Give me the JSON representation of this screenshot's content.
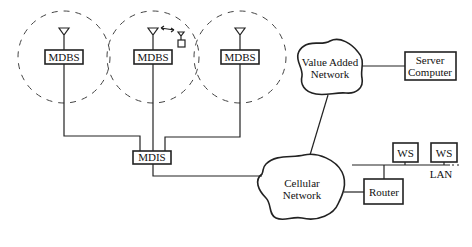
{
  "diagram": {
    "cells": [
      {
        "id": "cell-1",
        "station_label": "MDBS",
        "cx": 64,
        "cy": 57,
        "r": 46
      },
      {
        "id": "cell-2",
        "station_label": "MDBS",
        "cx": 153,
        "cy": 57,
        "r": 46,
        "has_mobile_unit": true
      },
      {
        "id": "cell-3",
        "station_label": "MDBS",
        "cx": 240,
        "cy": 57,
        "r": 46
      }
    ],
    "mdis": {
      "label": "MDIS"
    },
    "value_added_network": {
      "line1": "Value Added",
      "line2": "Network"
    },
    "server": {
      "line1": "Server",
      "line2": "Computer"
    },
    "cellular_network": {
      "line1": "Cellular",
      "line2": "Network"
    },
    "router": {
      "label": "Router"
    },
    "workstations": [
      {
        "label": "WS"
      },
      {
        "label": "WS"
      }
    ],
    "lan": {
      "label": "LAN"
    }
  }
}
